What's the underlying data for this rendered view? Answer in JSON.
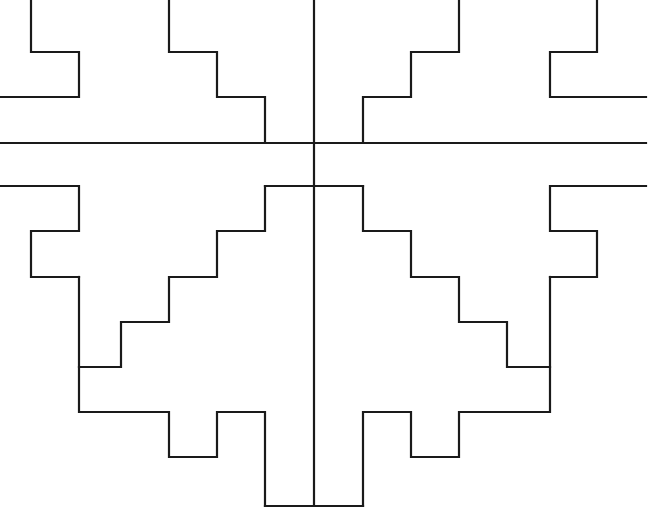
{
  "document": {
    "title": "Stepped Symmetric Line Diagram",
    "kind": "line-art-geometric-figure",
    "description": "Black outline stepped terrace motif, bilaterally symmetric about a vertical center axis, with a horizontal axis line crossing it.",
    "canvas": {
      "width": 650,
      "height": 510,
      "background_color": "#ffffff"
    },
    "style": {
      "stroke_color": "#1a1a1a",
      "stroke_width": 2.2,
      "fill": "none",
      "line_join": "miter",
      "line_cap": "square"
    },
    "geometry": {
      "grid_module_px": 48,
      "vertical_axis_x": 314,
      "horizontal_axis_y": 143,
      "symmetry": "bilateral-vertical"
    },
    "axes": {
      "vertical": {
        "label": "vertical-center-axis",
        "x": 314,
        "y_start": 0,
        "y_end": 506
      },
      "horizontal": {
        "label": "horizontal-axis",
        "y": 143,
        "x_start": 0,
        "x_end": 646
      }
    },
    "shapes": [
      {
        "name": "upper-stepped-outline",
        "label": "Upper terraced outline",
        "d": "M 0,97 L 79,97 L 79,52 L 31,52 L 31,0 L 79,0 L 79,0 M 31,0 L 31,52 L 79,52 L 79,97 L 0,97 M 169,0 L 169,0 L 169,0 M 169,0 L 217,0 L 217,0 M 169,0 L 169,0 Z"
      },
      {
        "name": "upper-left-bracket",
        "label": "Upper left bracket",
        "d": "M 0,97 L 79,97 L 79,52 L 31,52 L 31,0"
      },
      {
        "name": "upper-left-staircase",
        "label": "Upper left staircase descending to center",
        "d": "M 169,0 L 169,52 L 217,52 L 217,97 L 265,97 L 265,143"
      },
      {
        "name": "upper-right-staircase",
        "label": "Upper right staircase descending to center",
        "d": "M 459,0 L 459,52 L 411,52 L 411,97 L 363,97 L 363,143"
      },
      {
        "name": "upper-right-bracket",
        "label": "Upper right bracket",
        "d": "M 646,97 L 550,97 L 550,52 L 597,52 L 597,0"
      },
      {
        "name": "lower-left-bracket",
        "label": "Lower left bracket",
        "d": "M 0,186 L 79,186 L 79,231 L 31,231 L 31,277 L 79,277"
      },
      {
        "name": "lower-right-bracket",
        "label": "Lower right bracket",
        "d": "M 646,186 L 550,186 L 550,231 L 597,231 L 597,277 L 550,277"
      },
      {
        "name": "lower-left-terrace",
        "label": "Lower left terraced staircase",
        "d": "M 265,186 L 265,231 L 217,231 L 217,277 L 169,277 L 169,322 L 121,322 L 121,367 L 79,367 L 79,412 L 169,412 L 169,457 L 217,457 L 217,412 L 265,412 L 265,506"
      },
      {
        "name": "lower-right-terrace",
        "label": "Lower right terraced staircase",
        "d": "M 363,186 L 363,231 L 411,231 L 411,277 L 459,277 L 459,322 L 507,322 L 507,367 L 550,367 L 550,412 L 459,412 L 459,457 L 411,457 L 411,412 L 363,412 L 363,506"
      },
      {
        "name": "bottom-notch-base",
        "label": "Bottom notch base",
        "d": "M 265,506 L 363,506"
      },
      {
        "name": "lower-left-inner-riser",
        "label": "Lower left inner riser",
        "d": "M 79,277 L 79,367"
      },
      {
        "name": "lower-right-inner-riser",
        "label": "Lower right inner riser",
        "d": "M 550,277 L 550,367"
      },
      {
        "name": "upper-center-left-ledge",
        "label": "Upper center left ledge",
        "d": "M 265,143 L 363,143"
      },
      {
        "name": "lower-center-ledge",
        "label": "Lower center ledge between brackets",
        "d": "M 265,186 L 363,186"
      }
    ]
  }
}
